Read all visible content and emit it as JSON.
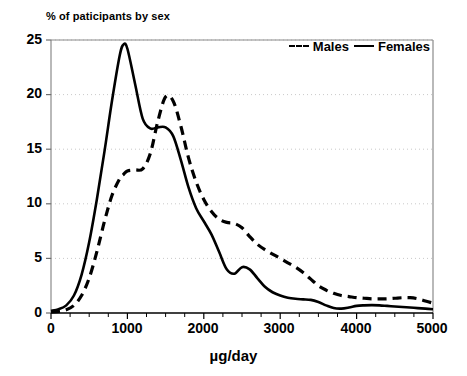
{
  "chart_data": {
    "type": "line",
    "title": "% of paticipants by sex",
    "xlabel": "µg/day",
    "ylabel": "",
    "xlim": [
      0,
      5000
    ],
    "ylim": [
      0,
      25
    ],
    "grid": true,
    "grid_axis": "y",
    "legend_position": "top-right",
    "xticks": [
      "0",
      "1000",
      "2000",
      "3000",
      "4000",
      "5000"
    ],
    "xtick_values": [
      0,
      1000,
      2000,
      3000,
      4000,
      5000
    ],
    "xminor_tick_interval": 250,
    "yticks": [
      "0",
      "5",
      "10",
      "15",
      "20",
      "25"
    ],
    "ytick_values": [
      0,
      5,
      10,
      15,
      20,
      25
    ],
    "x": [
      0,
      100,
      200,
      300,
      400,
      500,
      600,
      700,
      800,
      900,
      950,
      1000,
      1100,
      1200,
      1300,
      1400,
      1500,
      1600,
      1700,
      1800,
      1900,
      2000,
      2100,
      2200,
      2300,
      2400,
      2500,
      2600,
      2700,
      2800,
      2900,
      3000,
      3100,
      3200,
      3300,
      3400,
      3500,
      3600,
      3700,
      3800,
      3900,
      4000,
      4100,
      4200,
      4300,
      4400,
      4500,
      4600,
      4700,
      4800,
      4900,
      5000
    ],
    "series": [
      {
        "name": "Males",
        "linestyle": "dashed",
        "color": "#000000",
        "values": [
          0.1,
          0.15,
          0.3,
          0.7,
          1.6,
          3.2,
          5.6,
          8.4,
          10.8,
          12.3,
          12.7,
          13.0,
          13.1,
          13.2,
          14.6,
          17.6,
          19.8,
          19.4,
          17.1,
          14.2,
          12.0,
          10.4,
          9.3,
          8.6,
          8.3,
          8.2,
          7.8,
          7.0,
          6.3,
          5.8,
          5.4,
          5.0,
          4.6,
          4.2,
          3.7,
          3.1,
          2.5,
          2.1,
          1.8,
          1.6,
          1.5,
          1.4,
          1.35,
          1.3,
          1.3,
          1.3,
          1.35,
          1.4,
          1.4,
          1.3,
          1.1,
          0.9
        ]
      },
      {
        "name": "Females",
        "linestyle": "solid",
        "color": "#000000",
        "values": [
          0.2,
          0.35,
          0.7,
          1.6,
          3.5,
          6.5,
          10.4,
          14.8,
          19.5,
          23.6,
          24.6,
          24.2,
          21.0,
          17.8,
          16.9,
          17.0,
          17.0,
          16.2,
          14.0,
          11.5,
          9.6,
          8.4,
          7.2,
          5.6,
          4.0,
          3.6,
          4.2,
          4.0,
          3.2,
          2.4,
          1.9,
          1.6,
          1.4,
          1.3,
          1.25,
          1.2,
          1.0,
          0.7,
          0.45,
          0.4,
          0.5,
          0.65,
          0.7,
          0.72,
          0.7,
          0.65,
          0.6,
          0.55,
          0.5,
          0.45,
          0.4,
          0.35
        ]
      }
    ]
  },
  "legend": {
    "entries": [
      {
        "label": "Males",
        "style": "dashed"
      },
      {
        "label": "Females",
        "style": "solid"
      }
    ]
  }
}
